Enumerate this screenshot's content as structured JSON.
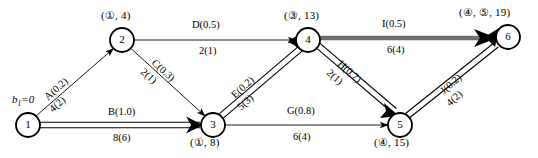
{
  "diagram": {
    "type": "activity-on-arc-network",
    "title": "",
    "source_label": "b₁=0",
    "nodes": [
      {
        "id": "1",
        "num": "1",
        "cx": 28,
        "cy": 125,
        "r": 12,
        "label": "",
        "label_pos": "none"
      },
      {
        "id": "2",
        "num": "2",
        "cx": 122,
        "cy": 40,
        "r": 12,
        "label": "(①, 4)",
        "label_pos": "above"
      },
      {
        "id": "3",
        "num": "3",
        "cx": 213,
        "cy": 125,
        "r": 12,
        "label": "(①, 8)",
        "label_pos": "below"
      },
      {
        "id": "4",
        "num": "4",
        "cx": 308,
        "cy": 40,
        "r": 12,
        "label": "(③, 13)",
        "label_pos": "above"
      },
      {
        "id": "5",
        "num": "5",
        "cx": 400,
        "cy": 125,
        "r": 12,
        "label": "(④, 15)",
        "label_pos": "below"
      },
      {
        "id": "6",
        "num": "6",
        "cx": 508,
        "cy": 37,
        "r": 12,
        "label": "(④, ⑤, 19)",
        "label_pos": "above"
      }
    ],
    "edges": [
      {
        "id": "A",
        "from": "1",
        "to": "2",
        "name": "A(0.2)",
        "value": "4(2)",
        "style": "thin",
        "rotated": true,
        "angle": -42
      },
      {
        "id": "B",
        "from": "1",
        "to": "3",
        "name": "B(1.0)",
        "value": "8(6)",
        "style": "double",
        "rotated": false,
        "angle": 0
      },
      {
        "id": "C",
        "from": "2",
        "to": "3",
        "name": "C(0.3)",
        "value": "2(1)",
        "style": "thin",
        "rotated": true,
        "angle": 42
      },
      {
        "id": "D",
        "from": "2",
        "to": "4",
        "name": "D(0.5)",
        "value": "2(1)",
        "style": "thin",
        "rotated": false,
        "angle": 0
      },
      {
        "id": "E",
        "from": "3",
        "to": "4",
        "name": "E(0.2)",
        "value": "5(3)",
        "style": "double",
        "rotated": true,
        "angle": -42
      },
      {
        "id": "G",
        "from": "3",
        "to": "5",
        "name": "G(0.8)",
        "value": "6(4)",
        "style": "thin",
        "rotated": false,
        "angle": 0
      },
      {
        "id": "H",
        "from": "4",
        "to": "5",
        "name": "H(0.7)",
        "value": "2(1)",
        "style": "double",
        "rotated": true,
        "angle": 42
      },
      {
        "id": "I",
        "from": "4",
        "to": "6",
        "name": "I(0.5)",
        "value": "6(4)",
        "style": "thick-gray",
        "rotated": false,
        "angle": 0
      },
      {
        "id": "J",
        "from": "5",
        "to": "6",
        "name": "J(0.2)",
        "value": "4(2)",
        "style": "double",
        "rotated": true,
        "angle": -42
      }
    ],
    "colors": {
      "stroke": "#000000",
      "critical_path": "#6e6e6e",
      "background": "#ffffff"
    }
  }
}
